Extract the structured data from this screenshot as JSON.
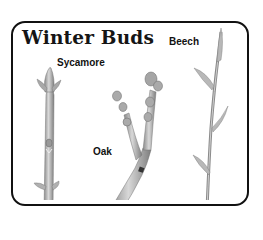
{
  "title": "Winter Buds",
  "labels": {
    "beech": "Beech",
    "sycamore": "Sycamore",
    "oak": "Oak"
  },
  "colors": {
    "border": "#111111",
    "background": "#ffffff",
    "twig": "#b5b5b5",
    "twig_shadow": "#7a7a7a"
  }
}
